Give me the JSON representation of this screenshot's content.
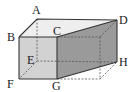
{
  "diagram": {
    "type": "prism-net-figure",
    "vertices": {
      "A": {
        "label": "A",
        "x": 37,
        "y": 19,
        "lx": 32,
        "ly": 14
      },
      "B": {
        "label": "B",
        "x": 19,
        "y": 37,
        "lx": 8,
        "ly": 41
      },
      "C": {
        "label": "C",
        "x": 57,
        "y": 37,
        "lx": 53,
        "ly": 35
      },
      "D": {
        "label": "D",
        "x": 117,
        "y": 20,
        "lx": 119,
        "ly": 24
      },
      "E": {
        "label": "E",
        "x": 37,
        "y": 61,
        "lx": 28,
        "ly": 64
      },
      "F": {
        "label": "F",
        "x": 19,
        "y": 79,
        "lx": 8,
        "ly": 88
      },
      "G": {
        "label": "G",
        "x": 57,
        "y": 79,
        "lx": 52,
        "ly": 90
      },
      "H": {
        "label": "H",
        "x": 117,
        "y": 62,
        "lx": 119,
        "ly": 66
      }
    },
    "colors": {
      "front_face": "#d2d2d2",
      "top_face": "#eeeeee",
      "side_face": "#9a9a9a",
      "edge": "#333333",
      "hidden_edge": "#555555"
    }
  }
}
